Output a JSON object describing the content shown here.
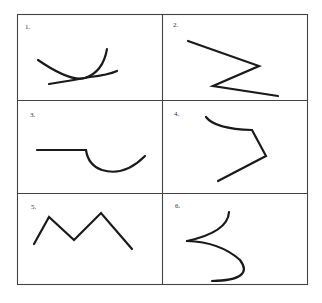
{
  "figure": {
    "kind": "grid of line drawings",
    "rows": 3,
    "columns": 2,
    "line_color": "#1a1a1a",
    "grid_color": "#444444",
    "cells": [
      {
        "label": "1.",
        "description": "two crossing curved arcs"
      },
      {
        "label": "2.",
        "description": "zigzag Z-shaped line"
      },
      {
        "label": "3.",
        "description": "horizontal line with semicircular hook"
      },
      {
        "label": "4.",
        "description": "curve joining angled broken line"
      },
      {
        "label": "5.",
        "description": "M-shaped zigzag line"
      },
      {
        "label": "6.",
        "description": "two curves meeting at a cusp"
      }
    ]
  }
}
